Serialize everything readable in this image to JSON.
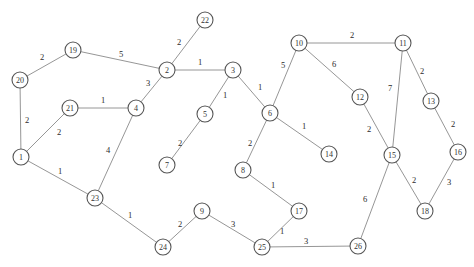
{
  "graph": {
    "type": "weighted-undirected-graph",
    "node_radius": 8,
    "colors": {
      "background": "#ffffff",
      "edge": "#8a8a8a",
      "node_stroke": "#555555",
      "node_fill": "#ffffff",
      "label": "#333333",
      "weight": "#2b2b2b"
    },
    "nodes": [
      {
        "id": "1",
        "label": "1",
        "x": 21,
        "y": 157
      },
      {
        "id": "2",
        "label": "2",
        "x": 167,
        "y": 70
      },
      {
        "id": "3",
        "label": "3",
        "x": 233,
        "y": 70
      },
      {
        "id": "4",
        "label": "4",
        "x": 136,
        "y": 108
      },
      {
        "id": "5",
        "label": "5",
        "x": 205,
        "y": 114
      },
      {
        "id": "6",
        "label": "6",
        "x": 270,
        "y": 113
      },
      {
        "id": "7",
        "label": "7",
        "x": 167,
        "y": 165
      },
      {
        "id": "8",
        "label": "8",
        "x": 243,
        "y": 170
      },
      {
        "id": "9",
        "label": "9",
        "x": 202,
        "y": 211
      },
      {
        "id": "10",
        "label": "10",
        "x": 299,
        "y": 43
      },
      {
        "id": "11",
        "label": "11",
        "x": 403,
        "y": 43
      },
      {
        "id": "12",
        "label": "12",
        "x": 360,
        "y": 97
      },
      {
        "id": "13",
        "label": "13",
        "x": 431,
        "y": 101
      },
      {
        "id": "14",
        "label": "14",
        "x": 329,
        "y": 154
      },
      {
        "id": "15",
        "label": "15",
        "x": 392,
        "y": 155
      },
      {
        "id": "16",
        "label": "16",
        "x": 458,
        "y": 152
      },
      {
        "id": "17",
        "label": "17",
        "x": 299,
        "y": 211
      },
      {
        "id": "18",
        "label": "18",
        "x": 425,
        "y": 211
      },
      {
        "id": "19",
        "label": "19",
        "x": 73,
        "y": 50
      },
      {
        "id": "20",
        "label": "20",
        "x": 20,
        "y": 80
      },
      {
        "id": "21",
        "label": "21",
        "x": 70,
        "y": 108
      },
      {
        "id": "22",
        "label": "22",
        "x": 205,
        "y": 20
      },
      {
        "id": "23",
        "label": "23",
        "x": 95,
        "y": 198
      },
      {
        "id": "24",
        "label": "24",
        "x": 163,
        "y": 247
      },
      {
        "id": "25",
        "label": "25",
        "x": 262,
        "y": 247
      },
      {
        "id": "26",
        "label": "26",
        "x": 358,
        "y": 246
      }
    ],
    "edges": [
      {
        "source": "20",
        "target": "19",
        "weight": "2",
        "lx": 42,
        "ly": 57
      },
      {
        "source": "19",
        "target": "2",
        "weight": "5",
        "lx": 121,
        "ly": 54
      },
      {
        "source": "2",
        "target": "22",
        "weight": "2",
        "lx": 179,
        "ly": 42
      },
      {
        "source": "2",
        "target": "3",
        "weight": "1",
        "lx": 200,
        "ly": 62
      },
      {
        "source": "2",
        "target": "4",
        "weight": "3",
        "lx": 148,
        "ly": 83
      },
      {
        "source": "20",
        "target": "1",
        "weight": "2",
        "lx": 27,
        "ly": 120
      },
      {
        "source": "21",
        "target": "4",
        "weight": "1",
        "lx": 103,
        "ly": 100
      },
      {
        "source": "21",
        "target": "1",
        "weight": "2",
        "lx": 59,
        "ly": 132
      },
      {
        "source": "4",
        "target": "23",
        "weight": "4",
        "lx": 108,
        "ly": 150
      },
      {
        "source": "1",
        "target": "23",
        "weight": "1",
        "lx": 60,
        "ly": 171
      },
      {
        "source": "3",
        "target": "5",
        "weight": "1",
        "lx": 225,
        "ly": 95
      },
      {
        "source": "3",
        "target": "6",
        "weight": "1",
        "lx": 260,
        "ly": 87
      },
      {
        "source": "5",
        "target": "7",
        "weight": "2",
        "lx": 180,
        "ly": 143
      },
      {
        "source": "6",
        "target": "8",
        "weight": "2",
        "lx": 250,
        "ly": 143
      },
      {
        "source": "6",
        "target": "14",
        "weight": "1",
        "lx": 304,
        "ly": 126
      },
      {
        "source": "6",
        "target": "10",
        "weight": "5",
        "lx": 283,
        "ly": 65
      },
      {
        "source": "10",
        "target": "11",
        "weight": "2",
        "lx": 352,
        "ly": 35
      },
      {
        "source": "10",
        "target": "12",
        "weight": "6",
        "lx": 334,
        "ly": 64
      },
      {
        "source": "11",
        "target": "13",
        "weight": "2",
        "lx": 422,
        "ly": 71
      },
      {
        "source": "11",
        "target": "15",
        "weight": "7",
        "lx": 390,
        "ly": 88
      },
      {
        "source": "12",
        "target": "15",
        "weight": "2",
        "lx": 369,
        "ly": 129
      },
      {
        "source": "13",
        "target": "16",
        "weight": "2",
        "lx": 453,
        "ly": 124
      },
      {
        "source": "15",
        "target": "18",
        "weight": "2",
        "lx": 414,
        "ly": 180
      },
      {
        "source": "16",
        "target": "18",
        "weight": "3",
        "lx": 449,
        "ly": 182
      },
      {
        "source": "15",
        "target": "26",
        "weight": "6",
        "lx": 365,
        "ly": 199
      },
      {
        "source": "8",
        "target": "17",
        "weight": "1",
        "lx": 273,
        "ly": 185
      },
      {
        "source": "17",
        "target": "25",
        "weight": "1",
        "lx": 282,
        "ly": 231
      },
      {
        "source": "25",
        "target": "26",
        "weight": "3",
        "lx": 306,
        "ly": 241
      },
      {
        "source": "9",
        "target": "25",
        "weight": "3",
        "lx": 233,
        "ly": 224
      },
      {
        "source": "9",
        "target": "24",
        "weight": "2",
        "lx": 180,
        "ly": 224
      },
      {
        "source": "23",
        "target": "24",
        "weight": "1",
        "lx": 130,
        "ly": 215
      }
    ]
  }
}
